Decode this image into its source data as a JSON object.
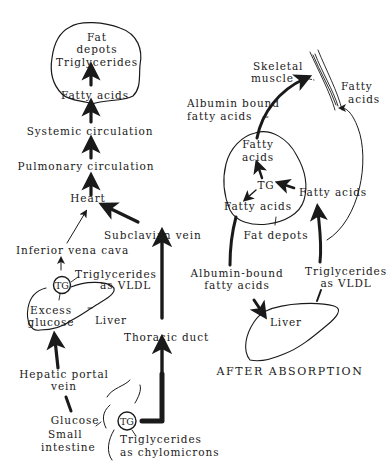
{
  "diagram": {
    "caption": "AFTER ABSORPTION",
    "left_pathway": {
      "fat_depots_title_line1": "Fat",
      "fat_depots_title_line2": "depots",
      "triglycerides": "Triglycerides",
      "fatty_acids": "Fatty acids",
      "systemic_circulation": "Systemic circulation",
      "pulmonary_circulation": "Pulmonary circulation",
      "heart": "Heart",
      "subclavian_vein": "Subclavian vein",
      "inferior_vena_cava": "Inferior vena cava",
      "tg_vldl_line1": "Triglycerides",
      "tg_vldl_line2": "as VLDL",
      "tg_badge_liver": "TG",
      "excess_glucose_line1": "Excess",
      "excess_glucose_line2": "glucose",
      "liver": "Liver",
      "thoracic_duct": "Thoracic duct",
      "hepatic_portal_line1": "Hepatic portal",
      "hepatic_portal_line2": "vein",
      "glucose": "Glucose",
      "small_intestine_line1": "Small",
      "small_intestine_line2": "intestine",
      "tg_badge_intestine": "TG",
      "tg_chylo_line1": "Triglycerides",
      "tg_chylo_line2": "as chylomicrons"
    },
    "right_pathway": {
      "skeletal_muscle_line1": "Skeletal",
      "skeletal_muscle_line2": "muscle",
      "muscle_fatty_acids_line1": "Fatty",
      "muscle_fatty_acids_line2": "acids",
      "albumin_bound_line1": "Albumin bound",
      "albumin_bound_line2": "fatty acids",
      "depot_fatty_acids_line1": "Fatty",
      "depot_fatty_acids_line2": "acids",
      "depot_tg": "TG",
      "depot_fatty_acids_lower": "Fatty acids",
      "incoming_fatty_acids": "Fatty acids",
      "fat_depots": "Fat depots",
      "albumin_bound2_line1": "Albumin-bound",
      "albumin_bound2_line2": "fatty acids",
      "tg_vldl_line1": "Triglycerides",
      "tg_vldl_line2": "as VLDL",
      "liver": "Liver"
    },
    "colors": {
      "ink": "#1a1a1a",
      "background": "#ffffff"
    }
  }
}
